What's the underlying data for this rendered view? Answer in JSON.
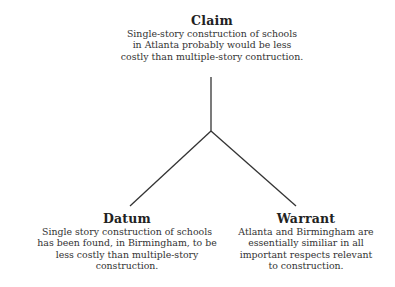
{
  "diagram": {
    "type": "toulmin-argument",
    "claim": {
      "title": "Claim",
      "text": "Single-story construction of schools in Atlanta probably would be less costly than multiple-story contruction.",
      "lines": [
        "Single-story construction of schools",
        "in Atlanta probably would be less",
        "costly than multiple-story contruction."
      ]
    },
    "datum": {
      "title": "Datum",
      "lines": [
        "Single story construction of schools",
        "has been found, in Birmingham, to be",
        "less costly than multiple-story",
        "construction."
      ]
    },
    "warrant": {
      "title": "Warrant",
      "lines": [
        "Atlanta and Birmingham are",
        "essentially similiar in all",
        "important respects relevant",
        "to construction."
      ]
    },
    "connectors": {
      "stroke_color": "#333333",
      "junction": [
        211,
        131
      ],
      "claim_end": [
        211,
        77
      ],
      "datum_end": [
        130,
        206
      ],
      "warrant_end": [
        296,
        206
      ]
    }
  }
}
